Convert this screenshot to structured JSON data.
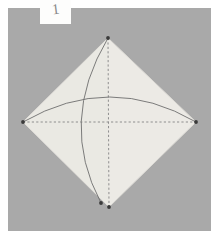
{
  "figure": {
    "step_label": "1",
    "canvas": {
      "width": 218,
      "height": 238
    },
    "colors": {
      "page_background": "#ffffff",
      "panel_background": "#a9a9a9",
      "paper_fill": "#eceae5",
      "paper_edge": "#d8d6d1",
      "fold_line": "#8e8e8e",
      "arc_line": "#6e6e6e",
      "vertex_dot": "#3a3a3a",
      "label_box": "#fdfdfc",
      "label_text": "#8a8a8a"
    },
    "panel": {
      "x": 8,
      "y": 8,
      "width": 203,
      "height": 223
    },
    "shape": {
      "name": "diamond",
      "description": "square rotated 45 degrees",
      "vertices": [
        {
          "name": "top",
          "x": 108,
          "y": 38
        },
        {
          "name": "right",
          "x": 196,
          "y": 122
        },
        {
          "name": "bottom",
          "x": 109,
          "y": 207
        },
        {
          "name": "left",
          "x": 23,
          "y": 122
        }
      ]
    },
    "fold_lines": [
      {
        "name": "horizontal-fold",
        "style": "dashed",
        "x1": 23,
        "y1": 122,
        "x2": 196,
        "y2": 122
      },
      {
        "name": "vertical-fold",
        "style": "dashed",
        "x1": 108,
        "y1": 38,
        "x2": 109,
        "y2": 207
      }
    ],
    "arcs": [
      {
        "name": "horizontal-motion-arc",
        "from": "left-vertex",
        "to": "right-vertex",
        "bulge": "upward",
        "apex_y": 95
      },
      {
        "name": "vertical-motion-arc",
        "from": "top-vertex",
        "to": "bottom-vertex",
        "bulge": "leftward",
        "apex_x": 79
      }
    ],
    "vertex_dots": [
      {
        "name": "dot-top",
        "x": 108,
        "y": 38
      },
      {
        "name": "dot-right",
        "x": 196,
        "y": 122
      },
      {
        "name": "dot-left",
        "x": 23,
        "y": 122
      },
      {
        "name": "dot-bottom",
        "x": 109,
        "y": 207
      },
      {
        "name": "dot-arc-end",
        "x": 101,
        "y": 203
      }
    ]
  }
}
